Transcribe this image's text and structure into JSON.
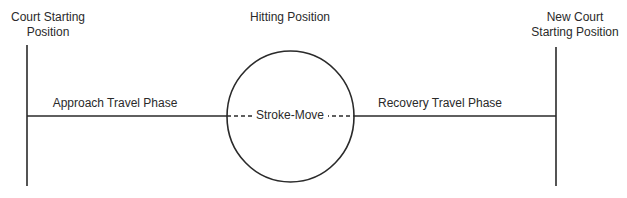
{
  "diagram": {
    "labels": {
      "court_starting_position": "Court Starting\nPosition",
      "hitting_position": "Hitting Position",
      "new_court_starting_position": "New Court\nStarting Position",
      "approach_travel_phase": "Approach Travel Phase",
      "recovery_travel_phase": "Recovery Travel Phase",
      "stroke_move": "Stroke-Move"
    },
    "colors": {
      "line": "#2a2a2a",
      "background": "#ffffff"
    }
  }
}
